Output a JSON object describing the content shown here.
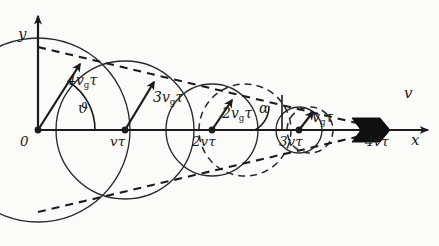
{
  "figure": {
    "type": "huygens-wavefront-construction",
    "background_color": "#fbfbfa",
    "ink_color": "#1b1b1b"
  },
  "axes": {
    "x_axis": {
      "label": "x",
      "origin_px": [
        38,
        130
      ],
      "end_px": [
        432,
        130
      ],
      "arrow": true
    },
    "y_axis": {
      "label": "y",
      "origin_px": [
        38,
        130
      ],
      "end_px": [
        38,
        10
      ],
      "arrow": true
    },
    "origin_label": "0"
  },
  "ticks": [
    {
      "label": "0",
      "x_px": 38
    },
    {
      "label": "vτ",
      "x_px": 125
    },
    {
      "label": "2vτ",
      "x_px": 212
    },
    {
      "label": "3vτ",
      "x_px": 299
    },
    {
      "label": "4vτ",
      "x_px": 386
    }
  ],
  "circles": [
    {
      "center_label": "0",
      "cx": 38,
      "cy": 130,
      "r": 92,
      "style": "solid"
    },
    {
      "center_label": "vτ",
      "cx": 125,
      "cy": 130,
      "r": 69,
      "style": "solid"
    },
    {
      "center_label": "2vτ",
      "cx": 212,
      "cy": 130,
      "r": 46,
      "style": "solid"
    },
    {
      "center_label": "3vτ",
      "cx": 299,
      "cy": 130,
      "r": 23,
      "style": "solid"
    },
    {
      "center_label": "vτ-dashed",
      "cx": 125,
      "cy": 130,
      "r": 69,
      "style": "dashed"
    },
    {
      "center_label": "2vτ-dashed",
      "cx": 245,
      "cy": 130,
      "r": 46,
      "style": "dashed"
    },
    {
      "center_label": "3vτ-dashed",
      "cx": 310,
      "cy": 130,
      "r": 23,
      "style": "dashed"
    }
  ],
  "vectors": [
    {
      "label_base": "4v",
      "label_sub": "g",
      "label_tail": "τ",
      "from": [
        38,
        130
      ],
      "to": [
        83,
        60
      ],
      "label_px": [
        66,
        83
      ]
    },
    {
      "label_base": "3v",
      "label_sub": "g",
      "label_tail": "τ",
      "from": [
        125,
        130
      ],
      "to": [
        156,
        78
      ],
      "label_px": [
        153,
        97
      ]
    },
    {
      "label_base": "2v",
      "label_sub": "g",
      "label_tail": "τ",
      "from": [
        212,
        130
      ],
      "to": [
        234,
        96
      ],
      "label_px": [
        227,
        114
      ]
    },
    {
      "label_base": "v",
      "label_sub": "g",
      "label_tail": "τ",
      "from": [
        299,
        130
      ],
      "to": [
        314,
        110
      ],
      "label_px": [
        311,
        114
      ]
    }
  ],
  "angles": [
    {
      "label": "ϑ",
      "at": [
        38,
        130
      ],
      "label_px": [
        82,
        109
      ]
    },
    {
      "label": "α",
      "at": [
        282,
        130
      ],
      "label_px": [
        262,
        109
      ]
    }
  ],
  "velocity_marker": {
    "label": "v",
    "label_px": [
      399,
      96
    ],
    "wedge_px": [
      355,
      130
    ]
  },
  "envelope": {
    "style": "dashed",
    "upper_from": [
      38,
      47
    ],
    "upper_to": [
      386,
      130
    ],
    "lower_from": [
      38,
      212
    ],
    "lower_to": [
      386,
      130
    ]
  }
}
